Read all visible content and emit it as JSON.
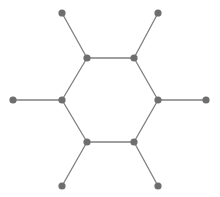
{
  "figure": {
    "width": 220,
    "height": 197,
    "background_color": "#ffffff"
  },
  "style": {
    "edge_color": "#808080",
    "edge_width": 1.3,
    "vertex_fill": "#6e6e6e",
    "vertex_radius": 3.6
  },
  "chart_data": {
    "type": "diagram",
    "subtype": "node-link-graph",
    "title": "",
    "xlabel": "",
    "ylabel": "",
    "grid": false,
    "legend": null,
    "xlim": [
      0,
      220
    ],
    "ylim": [
      0,
      197
    ],
    "node_count": 12,
    "edge_count": 12,
    "nodes": [
      {
        "id": "c1",
        "role": "ring",
        "label": "",
        "x": 87,
        "y": 58
      },
      {
        "id": "c2",
        "role": "ring",
        "label": "",
        "x": 134,
        "y": 58
      },
      {
        "id": "c3",
        "role": "ring",
        "label": "",
        "x": 158,
        "y": 100
      },
      {
        "id": "c4",
        "role": "ring",
        "label": "",
        "x": 134,
        "y": 142
      },
      {
        "id": "c5",
        "role": "ring",
        "label": "",
        "x": 87,
        "y": 142
      },
      {
        "id": "c6",
        "role": "ring",
        "label": "",
        "x": 62,
        "y": 100
      },
      {
        "id": "p1",
        "role": "pendant",
        "label": "",
        "x": 62,
        "y": 13
      },
      {
        "id": "p2",
        "role": "pendant",
        "label": "",
        "x": 158,
        "y": 13
      },
      {
        "id": "p3",
        "role": "pendant",
        "label": "",
        "x": 206,
        "y": 100
      },
      {
        "id": "p4",
        "role": "pendant",
        "label": "",
        "x": 158,
        "y": 186
      },
      {
        "id": "p5",
        "role": "pendant",
        "label": "",
        "x": 62,
        "y": 186
      },
      {
        "id": "p6",
        "role": "pendant",
        "label": "",
        "x": 13,
        "y": 100
      }
    ],
    "edges": [
      {
        "source": "c1",
        "target": "c2",
        "kind": "ring"
      },
      {
        "source": "c2",
        "target": "c3",
        "kind": "ring"
      },
      {
        "source": "c3",
        "target": "c4",
        "kind": "ring"
      },
      {
        "source": "c4",
        "target": "c5",
        "kind": "ring"
      },
      {
        "source": "c5",
        "target": "c6",
        "kind": "ring"
      },
      {
        "source": "c6",
        "target": "c1",
        "kind": "ring"
      },
      {
        "source": "c1",
        "target": "p1",
        "kind": "pendant"
      },
      {
        "source": "c2",
        "target": "p2",
        "kind": "pendant"
      },
      {
        "source": "c3",
        "target": "p3",
        "kind": "pendant"
      },
      {
        "source": "c4",
        "target": "p4",
        "kind": "pendant"
      },
      {
        "source": "c5",
        "target": "p5",
        "kind": "pendant"
      },
      {
        "source": "c6",
        "target": "p6",
        "kind": "pendant"
      }
    ]
  }
}
